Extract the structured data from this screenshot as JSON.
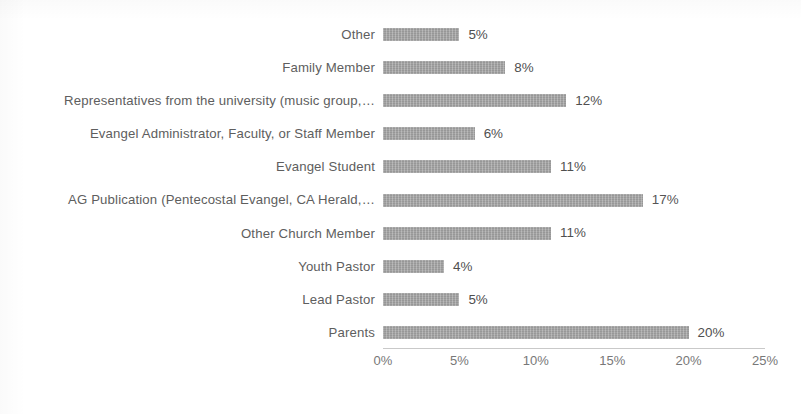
{
  "chart_data": {
    "type": "bar",
    "orientation": "horizontal",
    "title": "",
    "subtitle": "",
    "xlabel": "",
    "ylabel": "",
    "xlim": [
      0,
      25
    ],
    "x_tick_labels": [
      "0%",
      "5%",
      "10%",
      "15%",
      "20%",
      "25%"
    ],
    "x_ticks": [
      0,
      5,
      10,
      15,
      20,
      25
    ],
    "grid": false,
    "legend": false,
    "value_label_suffix": "%",
    "bar_color": "#9d9d9d",
    "text_color": "#585858",
    "categories": [
      "Other",
      "Family Member",
      "Representatives from the university (music group,…",
      "Evangel Administrator, Faculty, or Staff Member",
      "Evangel Student",
      "AG Publication (Pentecostal Evangel, CA Herald,…",
      "Other Church Member",
      "Youth Pastor",
      "Lead Pastor",
      "Parents"
    ],
    "values": [
      5,
      8,
      12,
      6,
      11,
      17,
      11,
      4,
      5,
      20
    ],
    "value_labels": [
      "5%",
      "8%",
      "12%",
      "6%",
      "11%",
      "17%",
      "11%",
      "4%",
      "5%",
      "20%"
    ],
    "bars": [
      {
        "category": "Other",
        "value": 5,
        "label": "5%",
        "degraded": false
      },
      {
        "category": "Family Member",
        "value": 8,
        "label": "8%",
        "degraded": false
      },
      {
        "category": "Representatives from the university (music group,…",
        "value": 12,
        "label": "12%",
        "degraded": false
      },
      {
        "category": "Evangel Administrator, Faculty, or Staff Member",
        "value": 6,
        "label": "6%",
        "degraded": false
      },
      {
        "category": "Evangel Student",
        "value": 11,
        "label": "11%",
        "degraded": false
      },
      {
        "category": "AG Publication (Pentecostal Evangel, CA Herald,…",
        "value": 17,
        "label": "17%",
        "degraded": true
      },
      {
        "category": "Other Church Member",
        "value": 11,
        "label": "11%",
        "degraded": false
      },
      {
        "category": "Youth Pastor",
        "value": 4,
        "label": "4%",
        "degraded": false
      },
      {
        "category": "Lead Pastor",
        "value": 5,
        "label": "5%",
        "degraded": false
      },
      {
        "category": "Parents",
        "value": 20,
        "label": "20%",
        "degraded": false
      }
    ]
  }
}
